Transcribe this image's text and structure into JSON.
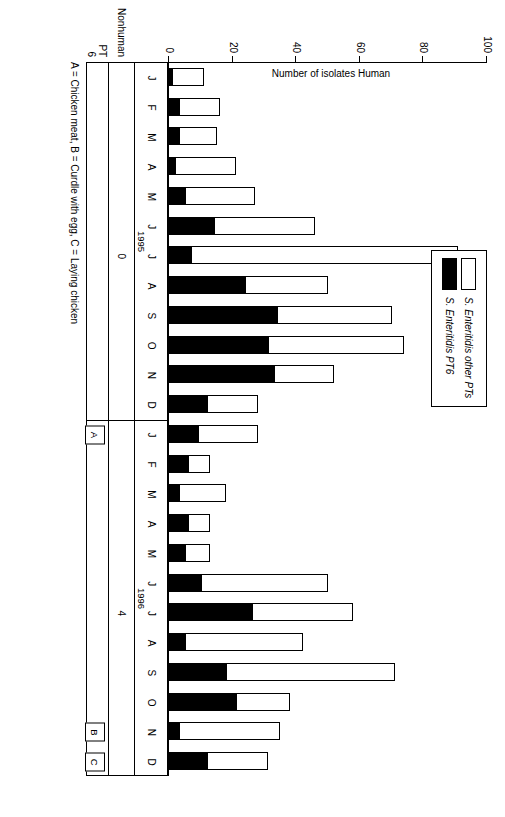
{
  "legend": {
    "items": [
      {
        "key": "other",
        "label": "S. Enteritidis other PTs",
        "color": "#ffffff"
      },
      {
        "key": "pt6",
        "label": "S. Enteritidis PT6",
        "color": "#000000"
      }
    ]
  },
  "axis": {
    "y_label": "Number of isolates\nHuman",
    "y_ticks": [
      0,
      20,
      40,
      60,
      80,
      100
    ],
    "y_max": 100
  },
  "rows": {
    "nonhuman_label": "Nonhuman",
    "pt6_label": "PT 6",
    "nonhuman_1995": "0",
    "nonhuman_1996": "4"
  },
  "caption": "A = Chicken meat, B = Curdle with egg, C = Laying chicken",
  "events": [
    {
      "label": "A",
      "month_index": 12
    },
    {
      "label": "B",
      "month_index": 22
    },
    {
      "label": "C",
      "month_index": 23
    }
  ],
  "years": [
    {
      "label": "1995",
      "start_index": 0,
      "end_index": 11
    },
    {
      "label": "1996",
      "start_index": 12,
      "end_index": 23
    }
  ],
  "chart_data": {
    "type": "bar",
    "subtype": "stacked-horizontal-rotated",
    "title": "",
    "xlabel": "",
    "ylabel": "Number of isolates Human",
    "ylim": [
      0,
      100
    ],
    "grid": false,
    "legend_position": "top-center",
    "categories": [
      "J",
      "F",
      "M",
      "A",
      "M",
      "J",
      "J",
      "A",
      "S",
      "O",
      "N",
      "D",
      "J",
      "F",
      "M",
      "A",
      "M",
      "J",
      "J",
      "A",
      "S",
      "O",
      "N",
      "D"
    ],
    "year_groups": [
      "1995",
      "1995",
      "1995",
      "1995",
      "1995",
      "1995",
      "1995",
      "1995",
      "1995",
      "1995",
      "1995",
      "1995",
      "1996",
      "1996",
      "1996",
      "1996",
      "1996",
      "1996",
      "1996",
      "1996",
      "1996",
      "1996",
      "1996",
      "1996"
    ],
    "series": [
      {
        "name": "S. Enteritidis PT6",
        "color": "#000000",
        "values": [
          1,
          3,
          3,
          2,
          5,
          14,
          7,
          24,
          34,
          31,
          33,
          12,
          9,
          6,
          3,
          6,
          5,
          10,
          26,
          5,
          18,
          21,
          3,
          12
        ]
      },
      {
        "name": "S. Enteritidis other PTs",
        "color": "#ffffff",
        "values": [
          10,
          13,
          12,
          19,
          22,
          32,
          84,
          26,
          36,
          43,
          19,
          16,
          19,
          7,
          15,
          7,
          8,
          40,
          32,
          37,
          53,
          17,
          32,
          19
        ]
      }
    ],
    "totals": [
      11,
      16,
      15,
      21,
      27,
      46,
      91,
      50,
      70,
      74,
      52,
      28,
      28,
      13,
      18,
      13,
      13,
      50,
      58,
      42,
      71,
      38,
      35,
      31
    ],
    "nonhuman_counts": {
      "1995": 0,
      "1996": 4
    },
    "annotations": [
      {
        "label": "A",
        "month": "J",
        "year": "1996",
        "meaning": "Chicken meat"
      },
      {
        "label": "B",
        "month": "N",
        "year": "1996",
        "meaning": "Curdle with egg"
      },
      {
        "label": "C",
        "month": "D",
        "year": "1996",
        "meaning": "Laying chicken"
      }
    ]
  }
}
